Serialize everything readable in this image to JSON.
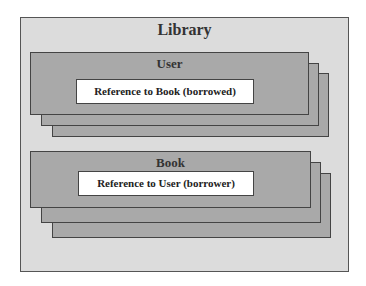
{
  "diagram": {
    "container": {
      "label": "Library"
    },
    "groups": [
      {
        "label": "User",
        "reference": "Reference to Book (borrowed)"
      },
      {
        "label": "Book",
        "reference": "Reference to User (borrower)"
      }
    ]
  }
}
